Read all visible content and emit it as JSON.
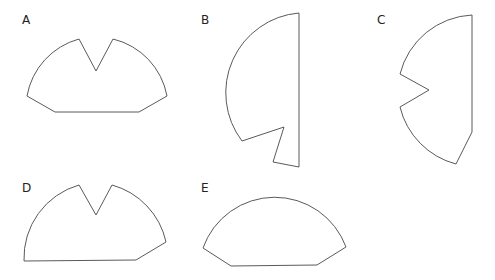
{
  "figure": {
    "stroke_color": "#5a5a5a",
    "background": "#ffffff"
  },
  "shapes": [
    {
      "label": "A",
      "label_pos": [
        22,
        14
      ]
    },
    {
      "label": "B",
      "label_pos": [
        201,
        14
      ]
    },
    {
      "label": "C",
      "label_pos": [
        377,
        14
      ]
    },
    {
      "label": "D",
      "label_pos": [
        22,
        182
      ]
    },
    {
      "label": "E",
      "label_pos": [
        201,
        182
      ]
    }
  ]
}
